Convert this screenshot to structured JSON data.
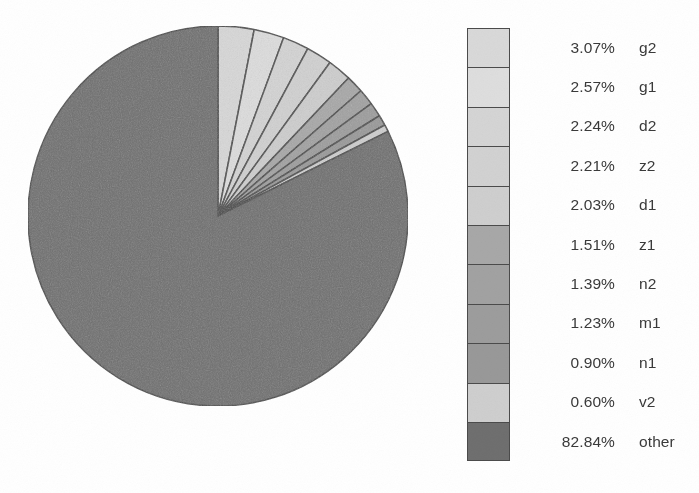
{
  "figure": {
    "background_color": "#ffffff",
    "width": 699,
    "height": 493
  },
  "chart_data": {
    "type": "pie",
    "title": "",
    "xlabel": "",
    "ylabel": "",
    "start_angle_deg": 0,
    "direction": "clockwise",
    "legend_position": "right",
    "grid": false,
    "categories": [
      "g2",
      "g1",
      "d2",
      "z2",
      "d1",
      "z1",
      "n2",
      "m1",
      "n1",
      "v2",
      "other"
    ],
    "values": [
      3.07,
      2.57,
      2.24,
      2.21,
      2.03,
      1.51,
      1.39,
      1.23,
      0.9,
      0.6,
      82.84
    ],
    "value_labels": [
      "3.07%",
      "2.57%",
      "2.24%",
      "2.21%",
      "2.03%",
      "1.51%",
      "1.39%",
      "1.23%",
      "0.90%",
      "0.60%",
      "82.84%"
    ],
    "units": "percent",
    "slice_colors": [
      "#d9d9d9",
      "#dedede",
      "#d5d5d5",
      "#d2d2d2",
      "#cfcfcf",
      "#a8a8a8",
      "#a2a2a2",
      "#9d9d9d",
      "#999999",
      "#cfcfcf",
      "#6f6f6f"
    ],
    "edge_color": "#4b4b4b"
  },
  "pie": {
    "center_x": 192,
    "center_y": 192,
    "radius": 190,
    "outline_color": "#4b4b4b"
  },
  "legend": {
    "items": [
      {
        "percent": "3.07%",
        "label": "g2",
        "color": "#d9d9d9"
      },
      {
        "percent": "2.57%",
        "label": "g1",
        "color": "#dedede"
      },
      {
        "percent": "2.24%",
        "label": "d2",
        "color": "#d5d5d5"
      },
      {
        "percent": "2.21%",
        "label": "z2",
        "color": "#d2d2d2"
      },
      {
        "percent": "2.03%",
        "label": "d1",
        "color": "#cfcfcf"
      },
      {
        "percent": "1.51%",
        "label": "z1",
        "color": "#a8a8a8"
      },
      {
        "percent": "1.39%",
        "label": "n2",
        "color": "#a2a2a2"
      },
      {
        "percent": "1.23%",
        "label": "m1",
        "color": "#9d9d9d"
      },
      {
        "percent": "0.90%",
        "label": "n1",
        "color": "#999999"
      },
      {
        "percent": "0.60%",
        "label": "v2",
        "color": "#cfcfcf"
      },
      {
        "percent": "82.84%",
        "label": "other",
        "color": "#6f6f6f"
      }
    ]
  }
}
